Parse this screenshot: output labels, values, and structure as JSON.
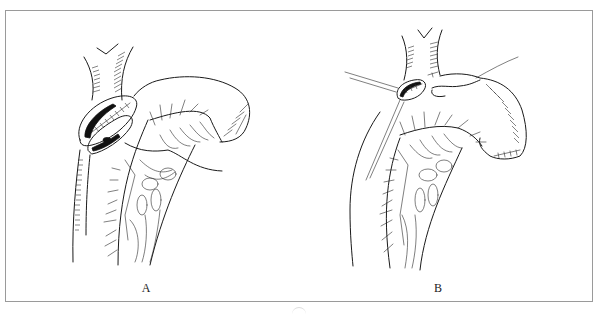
{
  "figure": {
    "type": "surgical-illustration",
    "frame_color": "#9a9a9a",
    "line_color": "#1a1a1a",
    "panels": [
      {
        "id": "A",
        "label": "A",
        "description": "Esophageal anastomosis with bowel loop and mesenteric vessel arcade"
      },
      {
        "id": "B",
        "label": "B",
        "description": "Completed anastomosis with sutures/threads and mesenteric vascular arcade"
      }
    ]
  }
}
